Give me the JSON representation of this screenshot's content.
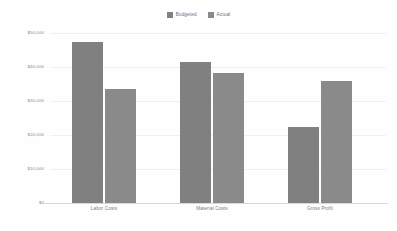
{
  "chart_data": {
    "type": "bar",
    "title": "",
    "xlabel": "",
    "ylabel": "",
    "categories": [
      "Labor Costs",
      "Material Costs",
      "Gross Profit"
    ],
    "series": [
      {
        "name": "Budgeted",
        "color": "#808080",
        "values": [
          47400,
          41500,
          22400
        ]
      },
      {
        "name": "Actual",
        "color": "#8a8a8a",
        "values": [
          33500,
          38200,
          35900
        ]
      }
    ],
    "ylim": [
      0,
      50000
    ],
    "yticks": [
      50000,
      40000,
      30000,
      20000,
      10000,
      0
    ],
    "ytick_labels": [
      "$50,000",
      "$40,000",
      "$30,000",
      "$20,000",
      "$10,000",
      "$0"
    ],
    "grid": true,
    "legend_position": "top-center"
  },
  "legend": {
    "entries": [
      {
        "label": "Budgeted",
        "color": "#808080"
      },
      {
        "label": "Actual",
        "color": "#8a8a8a"
      }
    ]
  },
  "axes": {
    "y_tick_labels": [
      "$50,000",
      "$40,000",
      "$30,000",
      "$20,000",
      "$10,000",
      "$0"
    ],
    "x_tick_labels": [
      "Labor Costs",
      "Material Costs",
      "Gross Profit"
    ]
  },
  "style": {
    "background": "#fefefe",
    "gridline_color": "#f0f0f0",
    "axis_color": "#d8d8d8",
    "tick_text_color": "#8a8a8a"
  }
}
